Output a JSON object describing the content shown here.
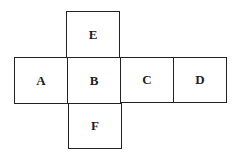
{
  "diagram": {
    "faces": {
      "top": "E",
      "left": "A",
      "center": "B",
      "right": "C",
      "far_right": "D",
      "bottom": "F"
    }
  }
}
